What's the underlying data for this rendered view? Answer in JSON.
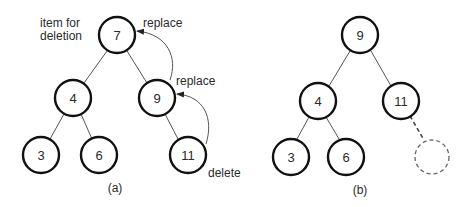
{
  "diagram_a": {
    "caption": "(a)",
    "annotations": {
      "item_for_deletion_line1": "item for",
      "item_for_deletion_line2": "deletion",
      "replace_top": "replace",
      "replace_mid": "replace",
      "delete": "delete"
    },
    "nodes": {
      "root": "7",
      "left": "4",
      "right": "9",
      "left_left": "3",
      "left_right": "6",
      "right_right": "11"
    }
  },
  "diagram_b": {
    "caption": "(b)",
    "nodes": {
      "root": "9",
      "left": "4",
      "right": "11",
      "left_left": "3",
      "left_right": "6",
      "right_right_removed": ""
    }
  }
}
